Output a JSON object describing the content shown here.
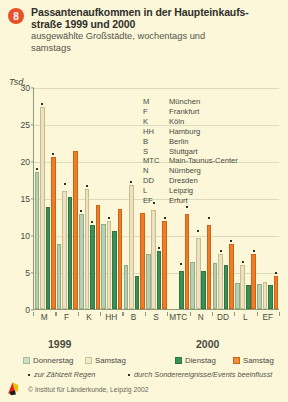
{
  "header": {
    "badge": "8",
    "title_line1": "Passantenaufkommen in der Haupteinkaufs-",
    "title_line2": "straße 1999 und 2000",
    "subtitle_line1": "ausgewählte Großstädte, wochentags und",
    "subtitle_line2": "samstags"
  },
  "unit_label": "Tsd.",
  "city_key": [
    {
      "abbr": "M",
      "name": "München"
    },
    {
      "abbr": "F",
      "name": "Frankfurt"
    },
    {
      "abbr": "K",
      "name": "Köln"
    },
    {
      "abbr": "HH",
      "name": "Hamburg"
    },
    {
      "abbr": "B",
      "name": "Berlin"
    },
    {
      "abbr": "S",
      "name": "Stuttgart"
    },
    {
      "abbr": "MTC",
      "name": "Main-Taunus-Center"
    },
    {
      "abbr": "N",
      "name": "Nürnberg"
    },
    {
      "abbr": "DD",
      "name": "Dresden"
    },
    {
      "abbr": "L",
      "name": "Leipzig"
    },
    {
      "abbr": "EF",
      "name": "Erfurt"
    }
  ],
  "year_captions": {
    "left": "1999",
    "right": "2000"
  },
  "legend": {
    "year_1999": "1999",
    "year_2000": "2000",
    "donnerstag": "Donnerstag",
    "samstag_1999": "Samstag",
    "dienstag": "Dienstag",
    "samstag_2000": "Samstag"
  },
  "footnotes": {
    "regen": "zur Zählzeit Regen",
    "events": "durch Sonderereignisse/Events beeinflusst"
  },
  "source": "© Institut für Länderkunde, Leipzig 2002",
  "colors": {
    "background": "#fbf7d8",
    "donnerstag_1999": "#b9cfb4",
    "samstag_1999": "#ece2c2",
    "dienstag_2000": "#3a9158",
    "samstag_2000": "#ef7c26",
    "badge": "#e8502a",
    "axis": "#8a9a7a"
  },
  "chart_data": {
    "type": "bar",
    "subtitle": "ausgewählte Großstädte, wochentags und samstags",
    "xlabel": "",
    "ylabel": "Tsd.",
    "ylim": [
      0,
      30
    ],
    "yticks": [
      0,
      5,
      10,
      15,
      20,
      25,
      30
    ],
    "grid": true,
    "legend_position": "bottom",
    "categories": [
      "M",
      "F",
      "K",
      "HH",
      "B",
      "S",
      "MTC",
      "N",
      "DD",
      "L",
      "EF"
    ],
    "category_names": [
      "München",
      "Frankfurt",
      "Köln",
      "Hamburg",
      "Berlin",
      "Stuttgart",
      "Main-Taunus-Center",
      "Nürnberg",
      "Dresden",
      "Leipzig",
      "Erfurt"
    ],
    "series": [
      {
        "name": "Donnerstag",
        "year": "1999",
        "color": "#b9cfb4",
        "values": [
          18.5,
          8.8,
          12.8,
          11.5,
          5.9,
          7.4,
          null,
          6.4,
          6.2,
          3.5,
          3.4
        ]
      },
      {
        "name": "Samstag",
        "year": "1999",
        "color": "#ece2c2",
        "values": [
          27.3,
          16.0,
          16.2,
          11.9,
          16.8,
          13.4,
          null,
          9.6,
          7.5,
          5.9,
          3.6
        ]
      },
      {
        "name": "Dienstag",
        "year": "2000",
        "color": "#3a9158",
        "values": [
          13.8,
          15.2,
          11.3,
          10.6,
          4.5,
          7.9,
          5.1,
          5.2,
          6.0,
          3.2,
          3.3
        ]
      },
      {
        "name": "Samstag",
        "year": "2000",
        "color": "#ef7c26",
        "values": [
          20.6,
          21.3,
          14.0,
          13.5,
          13.0,
          11.9,
          12.8,
          11.4,
          8.8,
          7.5,
          4.4
        ]
      }
    ],
    "markers": {
      "description": "Small dots above bars: one dot = Regen (rain at count time), raised dot = influenced by special events",
      "points": [
        {
          "category": "M",
          "series": "Donnerstag",
          "type": "regen"
        },
        {
          "category": "M",
          "series": "Samstag 1999",
          "type": "regen"
        },
        {
          "category": "M",
          "series": "Samstag 2000",
          "type": "regen"
        },
        {
          "category": "F",
          "series": "Samstag 1999",
          "type": "events"
        },
        {
          "category": "K",
          "series": "Donnerstag",
          "type": "regen"
        },
        {
          "category": "K",
          "series": "Samstag 1999",
          "type": "regen"
        },
        {
          "category": "K",
          "series": "Dienstag",
          "type": "regen"
        },
        {
          "category": "HH",
          "series": "Samstag 1999",
          "type": "regen"
        },
        {
          "category": "B",
          "series": "Samstag 1999",
          "type": "regen"
        },
        {
          "category": "S",
          "series": "Samstag 1999",
          "type": "events"
        },
        {
          "category": "S",
          "series": "Dienstag",
          "type": "regen"
        },
        {
          "category": "S",
          "series": "Samstag 2000",
          "type": "regen"
        },
        {
          "category": "MTC",
          "series": "Dienstag",
          "type": "events"
        },
        {
          "category": "MTC",
          "series": "Samstag 2000",
          "type": "events"
        },
        {
          "category": "N",
          "series": "Samstag 1999",
          "type": "events"
        },
        {
          "category": "N",
          "series": "Samstag 2000",
          "type": "events"
        },
        {
          "category": "DD",
          "series": "Samstag 1999",
          "type": "regen"
        },
        {
          "category": "DD",
          "series": "Samstag 2000",
          "type": "regen"
        },
        {
          "category": "L",
          "series": "Samstag 1999",
          "type": "regen"
        },
        {
          "category": "L",
          "series": "Samstag 2000",
          "type": "regen"
        },
        {
          "category": "EF",
          "series": "Samstag 2000",
          "type": "regen"
        }
      ]
    }
  }
}
